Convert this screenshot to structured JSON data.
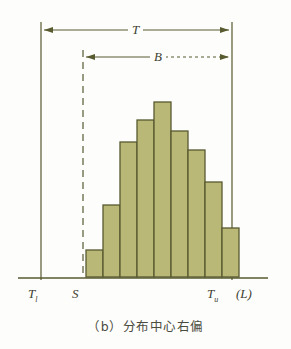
{
  "figure": {
    "caption": "（b）分布中心右偏",
    "background_color": "#fdfdfb",
    "bar_fill_color": "#b9b877",
    "bar_stroke_color": "#585a30",
    "line_color": "#585a30",
    "text_color": "#3d3f32"
  },
  "labels": {
    "span_total": "T",
    "span_process": "B",
    "tolerance_lower_main": "T",
    "tolerance_lower_sub": "l",
    "spec_start": "S",
    "tolerance_upper_main": "T",
    "tolerance_upper_sub": "u",
    "dimension_symbol": "(L)"
  },
  "chart_data": {
    "type": "bar",
    "title": "（b）分布中心右偏",
    "xlabel": "",
    "ylabel": "",
    "grid": false,
    "legend": null,
    "categories": [
      "1",
      "2",
      "3",
      "4",
      "5",
      "6",
      "7",
      "8",
      "9"
    ],
    "values": [
      27,
      72,
      135,
      157,
      175,
      146,
      127,
      95,
      49
    ],
    "ylim": [
      0,
      185
    ],
    "bar_left_px": [
      86,
      103,
      120,
      137,
      154,
      171,
      188,
      205,
      222
    ],
    "bar_width_px": 17,
    "baseline_y_px": 277,
    "bar_top_y_px": [
      250,
      205,
      142,
      120,
      102,
      131,
      150,
      182,
      228
    ],
    "annotations": [
      {
        "name": "T",
        "type": "double-arrow",
        "from_x_px": 41,
        "to_x_px": 232,
        "y_px": 30,
        "style": "solid"
      },
      {
        "name": "B",
        "type": "double-arrow",
        "from_x_px": 83,
        "to_x_px": 232,
        "y_px": 57,
        "style": "dotted-right"
      }
    ],
    "reference_lines": [
      {
        "name": "T_l",
        "x_px": 41,
        "style": "solid"
      },
      {
        "name": "S",
        "x_px": 83,
        "style": "dashed"
      },
      {
        "name": "T_u",
        "x_px": 232,
        "style": "solid"
      }
    ],
    "axis_line": {
      "from_x_px": 18,
      "to_x_px": 268,
      "y_px": 277
    }
  }
}
